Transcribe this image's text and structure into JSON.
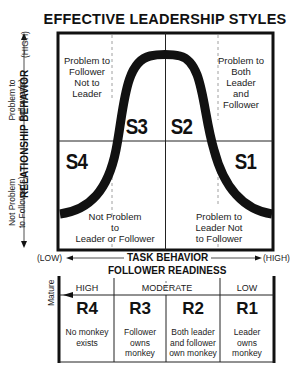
{
  "title": "EFFECTIVE LEADERSHIP STYLES",
  "axes": {
    "y_label": "RELATIONSHIP BEHAVIOR",
    "y_high": "(HIGH)",
    "y_low": "(LOW)",
    "y_upper_note": "Problem to Follower(s)",
    "y_upper_note_lines": [
      "Problem to",
      "Follower(s)"
    ],
    "y_lower_note_lines": [
      "Not Problem",
      "to Follower(s)"
    ],
    "x_label": "TASK BEHAVIOR",
    "x_low": "(LOW)",
    "x_high": "(HIGH)"
  },
  "quadrants": {
    "S3": {
      "label": "S3",
      "note_lines": [
        "Problem to",
        "Follower",
        "Not to",
        "Leader"
      ]
    },
    "S2": {
      "label": "S2",
      "note_lines": [
        "Problem to",
        "Both",
        "Leader",
        "and",
        "Follower"
      ]
    },
    "S4": {
      "label": "S4",
      "note_lines": [
        "Not Problem",
        "to",
        "Leader or Follower"
      ]
    },
    "S1": {
      "label": "S1",
      "note_lines": [
        "Problem to",
        "Leader Not",
        "to Follower"
      ]
    }
  },
  "readiness": {
    "title": "FOLLOWER READINESS",
    "side_label": "Mature",
    "levels": [
      {
        "header": "HIGH"
      },
      {
        "header": "MODERATE"
      },
      {
        "header": "LOW"
      }
    ],
    "columns": [
      {
        "code": "R4",
        "desc_lines": [
          "No monkey",
          "exists"
        ]
      },
      {
        "code": "R3",
        "desc_lines": [
          "Follower",
          "owns",
          "monkey"
        ]
      },
      {
        "code": "R2",
        "desc_lines": [
          "Both leader",
          "and follower",
          "own monkey"
        ]
      },
      {
        "code": "R1",
        "desc_lines": [
          "Leader",
          "owns",
          "monkey"
        ]
      }
    ]
  },
  "colors": {
    "ink": "#111111",
    "text": "#222222",
    "dashed": "#888888",
    "background": "#ffffff"
  }
}
